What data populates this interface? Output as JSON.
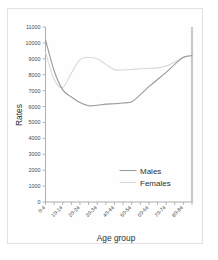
{
  "chart_data": {
    "type": "line",
    "title": "",
    "xlabel": "Age group",
    "ylabel": "Rates",
    "ylim": [
      0,
      11000
    ],
    "ytick_values": [
      0,
      1000,
      2000,
      3000,
      4000,
      5000,
      6000,
      7000,
      8000,
      9000,
      10000,
      11000
    ],
    "ytick_labels": [
      "0",
      "1000",
      "2000",
      "3000",
      "4000",
      "5000",
      "6000",
      "7000",
      "8000",
      "9000",
      "10000",
      "11000"
    ],
    "grid": false,
    "legend_position": "center-right",
    "categories": [
      "0-4",
      "5-9",
      "10-14",
      "15-19",
      "20-24",
      "25-29",
      "30-34",
      "35-39",
      "40-44",
      "45-49",
      "50-54",
      "55-59",
      "60-64",
      "65-69",
      "70-74",
      "75-79",
      "80-84",
      "85+"
    ],
    "xtick_labels": [
      "0-4",
      "10-14",
      "20-24",
      "30-34",
      "40-44",
      "50-54",
      "60-64",
      "70-74",
      "80-84"
    ],
    "series": [
      {
        "name": "Males",
        "color": "#999999",
        "values": [
          10200,
          8250,
          7050,
          6600,
          6250,
          6050,
          6080,
          6150,
          6180,
          6220,
          6300,
          6750,
          7250,
          7700,
          8150,
          8650,
          9100,
          9200
        ]
      },
      {
        "name": "Females",
        "color": "#d8d8d8",
        "values": [
          9400,
          7700,
          7200,
          8100,
          8950,
          9080,
          9000,
          8650,
          8320,
          8300,
          8330,
          8380,
          8400,
          8430,
          8550,
          8800,
          9080,
          9200
        ]
      }
    ]
  },
  "legend": {
    "entries": [
      {
        "label": "Males",
        "color": "#999999"
      },
      {
        "label": "Females",
        "color": "#d8d8d8"
      }
    ]
  },
  "axes": {
    "x_title": "Age group",
    "y_title": "Rates"
  }
}
